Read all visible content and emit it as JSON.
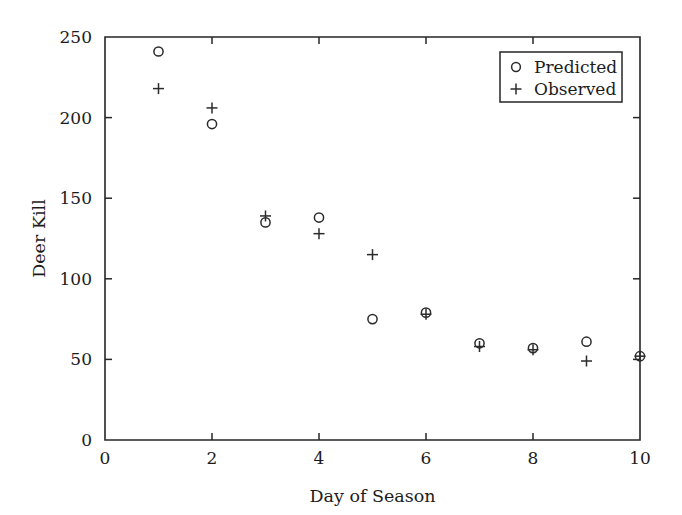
{
  "chart_data": {
    "type": "scatter",
    "title": "",
    "xlabel": "Day of Season",
    "ylabel": "Deer Kill",
    "xlim": [
      0,
      10
    ],
    "ylim": [
      0,
      250
    ],
    "xticks": [
      0,
      2,
      4,
      6,
      8,
      10
    ],
    "yticks": [
      0,
      50,
      100,
      150,
      200,
      250
    ],
    "xtick_labels": [
      "0",
      "2",
      "4",
      "6",
      "8",
      "10"
    ],
    "ytick_labels": [
      "0",
      "50",
      "100",
      "150",
      "200",
      "250"
    ],
    "grid": false,
    "legend_position": "top-right",
    "x": [
      1,
      2,
      3,
      4,
      5,
      6,
      7,
      8,
      9,
      10
    ],
    "series": [
      {
        "name": "Predicted",
        "marker": "circle",
        "values": [
          241,
          196,
          135,
          138,
          75,
          79,
          60,
          57,
          61,
          52
        ]
      },
      {
        "name": "Observed",
        "marker": "plus",
        "values": [
          218,
          206,
          139,
          128,
          115,
          78,
          58,
          56,
          49,
          52
        ]
      }
    ]
  },
  "legend": {
    "entries": [
      {
        "symbol": "o",
        "label": "Predicted"
      },
      {
        "symbol": "+",
        "label": "Observed"
      }
    ]
  },
  "colors": {
    "axis": "#262626",
    "marker": "#2b2b2b",
    "text": "#1c1c1c",
    "background": "#ffffff"
  }
}
